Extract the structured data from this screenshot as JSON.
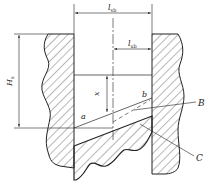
{
  "figure": {
    "type": "technical cross-section diagram",
    "labels": {
      "top_width": {
        "main": "l",
        "sub": "sb"
      },
      "right_width": {
        "main": "l",
        "sub": "xb"
      },
      "height": {
        "main": "H",
        "sub": "s"
      },
      "offset": "x",
      "point_a": "a",
      "point_b": "b",
      "callout_B": "B",
      "callout_C": "C"
    },
    "colors": {
      "line": "#222222",
      "hatch": "#333333",
      "background": "#ffffff"
    }
  }
}
